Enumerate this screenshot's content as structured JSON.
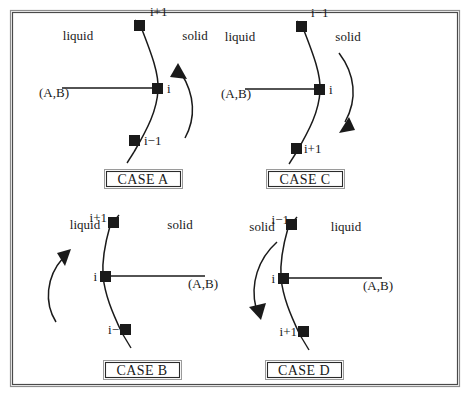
{
  "figure": {
    "frame": {
      "color": "#6f6f6f"
    },
    "ink_color": "#1a1a1a",
    "phase_labels": {
      "liquid": "liquid",
      "solid": "solid"
    },
    "coordinate_label": "(A,B)",
    "node_labels": {
      "prev": "i−1",
      "current": "i",
      "next": "i+1"
    },
    "cases": [
      {
        "id": "case-a",
        "label": "CASE A",
        "left_phase": "liquid",
        "right_phase": "solid",
        "top_node": "i+1",
        "middle_node": "i",
        "bottom_node": "i−1",
        "ab_label": "(A,B)",
        "ab_side": "left",
        "arrow_side": "right",
        "arrow_direction": "up"
      },
      {
        "id": "case-c",
        "label": "CASE C",
        "left_phase": "liquid",
        "right_phase": "solid",
        "top_node": "i−1",
        "middle_node": "i",
        "bottom_node": "i+1",
        "ab_label": "(A,B)",
        "ab_side": "left",
        "arrow_side": "right",
        "arrow_direction": "down"
      },
      {
        "id": "case-b",
        "label": "CASE B",
        "left_phase": "liquid",
        "right_phase": "solid",
        "top_node": "i+1",
        "middle_node": "i",
        "bottom_node": "i−",
        "ab_label": "(A,B)",
        "ab_side": "right",
        "arrow_side": "left",
        "arrow_direction": "up"
      },
      {
        "id": "case-d",
        "label": "CASE D",
        "left_phase": "solid",
        "right_phase": "liquid",
        "top_node": "i−1",
        "middle_node": "i",
        "bottom_node": "i+1",
        "ab_label": "(A,B)",
        "ab_side": "right",
        "arrow_side": "left",
        "arrow_direction": "down"
      }
    ]
  }
}
